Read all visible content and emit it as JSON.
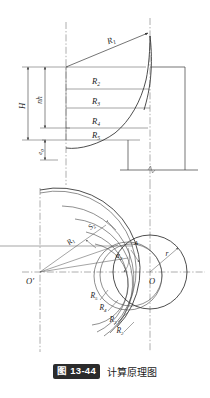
{
  "figure": {
    "badge": "图 13-44",
    "caption": "计算原理图"
  },
  "upper_view": {
    "name": "elevation-view",
    "dimensions": [
      {
        "id": "H",
        "label": "H",
        "orientation": "vertical",
        "position": "outer-left"
      },
      {
        "id": "nh",
        "label": "nh",
        "orientation": "vertical",
        "position": "inner-left"
      },
      {
        "id": "e",
        "label": "e",
        "subscript": "0",
        "orientation": "vertical",
        "position": "lower-left"
      }
    ],
    "radii": [
      {
        "id": "R1",
        "label": "R",
        "subscript": "1"
      },
      {
        "id": "R2",
        "label": "R",
        "subscript": "2"
      },
      {
        "id": "R3",
        "label": "R",
        "subscript": "3"
      },
      {
        "id": "R4",
        "label": "R",
        "subscript": "4"
      },
      {
        "id": "R5",
        "label": "R",
        "subscript": "5"
      }
    ]
  },
  "lower_view": {
    "name": "plan-view",
    "centers": [
      {
        "id": "O-prime",
        "label": "O",
        "prime": "′",
        "side": "left"
      },
      {
        "id": "O",
        "label": "O",
        "side": "right"
      }
    ],
    "radii": [
      {
        "id": "R1",
        "label": "R",
        "subscript": "1"
      },
      {
        "id": "R2",
        "label": "R",
        "subscript": "2"
      },
      {
        "id": "R3",
        "label": "R",
        "subscript": "3"
      },
      {
        "id": "R4",
        "label": "R",
        "subscript": "4"
      },
      {
        "id": "R5",
        "label": "R",
        "subscript": "5"
      }
    ],
    "annotations": [
      {
        "id": "S2",
        "label": "S",
        "subscript": "2"
      },
      {
        "id": "alpha2",
        "label": "α",
        "subscript": "2"
      },
      {
        "id": "A",
        "label": "A"
      },
      {
        "id": "r",
        "label": "r"
      }
    ]
  },
  "colors": {
    "line": "#3a3a3a",
    "curve": "#2e2e2e",
    "centerline": "#6a6a6a",
    "badge_bg": "#2b2b2b",
    "badge_text": "#ffffff",
    "text": "#1c1c1c",
    "background": "#ffffff"
  }
}
